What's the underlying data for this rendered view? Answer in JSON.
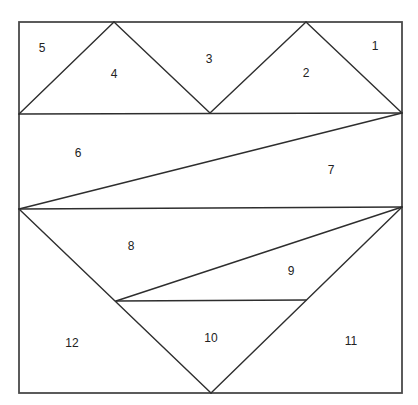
{
  "diagram": {
    "title": "",
    "frame": {
      "x1": 19,
      "y1": 22,
      "x2": 402,
      "y2": 393
    },
    "lines": [
      {
        "id": "top-band-bottom",
        "x1": 19,
        "y1": 114,
        "x2": 402,
        "y2": 113
      },
      {
        "id": "apex4-left",
        "x1": 19,
        "y1": 114,
        "x2": 114,
        "y2": 22
      },
      {
        "id": "apex4-right",
        "x1": 114,
        "y1": 22,
        "x2": 210,
        "y2": 113
      },
      {
        "id": "apex2-left",
        "x1": 210,
        "y1": 113,
        "x2": 306,
        "y2": 22
      },
      {
        "id": "apex2-right",
        "x1": 306,
        "y1": 22,
        "x2": 402,
        "y2": 113
      },
      {
        "id": "middle-diagonal",
        "x1": 19,
        "y1": 209,
        "x2": 402,
        "y2": 113
      },
      {
        "id": "middle-band-bottom",
        "x1": 19,
        "y1": 209,
        "x2": 402,
        "y2": 207
      },
      {
        "id": "big-v-left",
        "x1": 19,
        "y1": 209,
        "x2": 211,
        "y2": 393
      },
      {
        "id": "big-v-right",
        "x1": 211,
        "y1": 393,
        "x2": 402,
        "y2": 207
      },
      {
        "id": "inner-diagonal",
        "x1": 116,
        "y1": 301,
        "x2": 402,
        "y2": 207
      },
      {
        "id": "inner-horizontal",
        "x1": 116,
        "y1": 301,
        "x2": 306,
        "y2": 300
      }
    ],
    "labels": [
      {
        "text": "1",
        "x": 375,
        "y": 47
      },
      {
        "text": "2",
        "x": 306,
        "y": 74
      },
      {
        "text": "3",
        "x": 209,
        "y": 60
      },
      {
        "text": "4",
        "x": 114,
        "y": 75
      },
      {
        "text": "5",
        "x": 42,
        "y": 49
      },
      {
        "text": "6",
        "x": 78,
        "y": 154
      },
      {
        "text": "7",
        "x": 331,
        "y": 171
      },
      {
        "text": "8",
        "x": 131,
        "y": 247
      },
      {
        "text": "9",
        "x": 291,
        "y": 272
      },
      {
        "text": "10",
        "x": 211,
        "y": 339
      },
      {
        "text": "11",
        "x": 351,
        "y": 342
      },
      {
        "text": "12",
        "x": 72,
        "y": 344
      }
    ]
  }
}
